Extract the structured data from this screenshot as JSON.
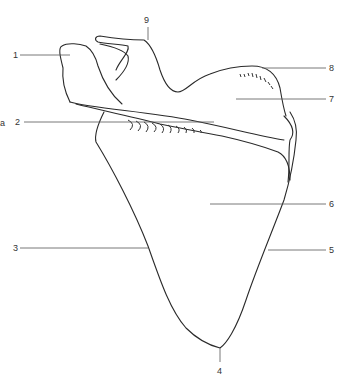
{
  "diagram": {
    "stray_mark": "a",
    "labels": [
      {
        "id": "1",
        "text": "1"
      },
      {
        "id": "2",
        "text": "2"
      },
      {
        "id": "3",
        "text": "3"
      },
      {
        "id": "4",
        "text": "4"
      },
      {
        "id": "5",
        "text": "5"
      },
      {
        "id": "6",
        "text": "6"
      },
      {
        "id": "7",
        "text": "7"
      },
      {
        "id": "8",
        "text": "8"
      },
      {
        "id": "9",
        "text": "9"
      }
    ],
    "colors": {
      "line": "#2a2a2a",
      "leader": "#555555",
      "background": "#ffffff"
    }
  }
}
